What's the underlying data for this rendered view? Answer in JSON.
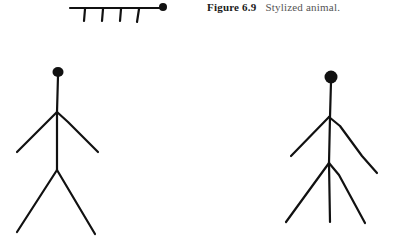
{
  "caption": {
    "label": "Figure 6.9",
    "text": "Stylized animal."
  },
  "colors": {
    "ink": "#111111",
    "background": "#ffffff",
    "caption_text": "#555555"
  },
  "figures": [
    {
      "name": "stylized-animal",
      "description": "horizontal line with a round head and four legs"
    },
    {
      "name": "stick-figure-left",
      "description": "stick figure with two arms and two legs"
    },
    {
      "name": "stick-figure-right",
      "description": "stick figure with two arms and three legs"
    }
  ]
}
